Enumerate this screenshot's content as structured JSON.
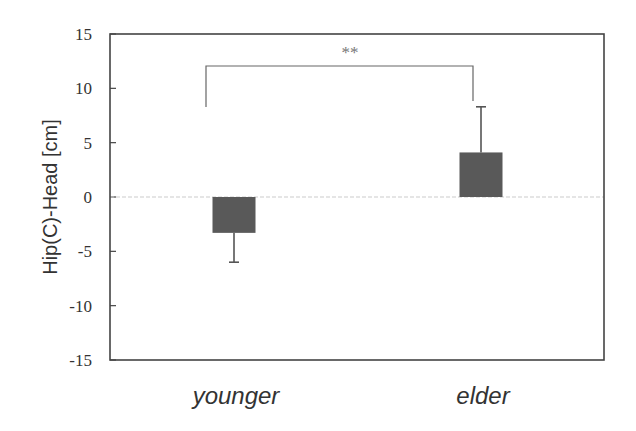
{
  "chart_data": {
    "type": "bar",
    "title": "",
    "xlabel": "",
    "ylabel": "Hip(C)-Head [cm]",
    "categories": [
      "younger",
      "elder"
    ],
    "values": [
      -3.3,
      4.1
    ],
    "error": [
      2.7,
      4.2
    ],
    "error_direction": [
      "down",
      "up"
    ],
    "ylim": [
      -15,
      15
    ],
    "yticks": [
      15,
      10,
      5,
      0,
      -5,
      -10,
      -15
    ],
    "grid": false,
    "zero_line": true,
    "annotations": [
      {
        "text": "**",
        "between": [
          "younger",
          "elder"
        ],
        "meaning": "significance bracket"
      }
    ],
    "colors": {
      "bar": "#595959",
      "frame": "#444444",
      "zero_line": "#cccccc"
    }
  }
}
